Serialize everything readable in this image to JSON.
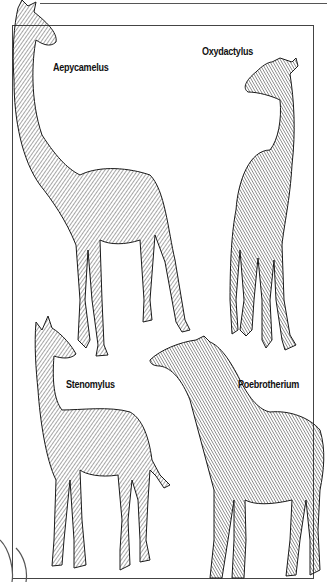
{
  "plate": {
    "species": [
      {
        "name": "Aepycamelus",
        "x": 53,
        "y": 62
      },
      {
        "name": "Oxydactylus",
        "x": 202,
        "y": 45
      },
      {
        "name": "Stenomylus",
        "x": 66,
        "y": 378
      },
      {
        "name": "Poebrotherium",
        "x": 238,
        "y": 378
      }
    ]
  },
  "colors": {
    "ink": "#1a1a1a",
    "frame": "#444444",
    "paper": "#ffffff"
  }
}
